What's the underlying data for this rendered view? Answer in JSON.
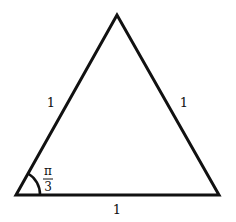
{
  "diagram": {
    "type": "equilateral-triangle",
    "vertices": {
      "apex": [
        117,
        15
      ],
      "bottom_left": [
        16,
        195
      ],
      "bottom_right": [
        219,
        195
      ]
    },
    "stroke_color": "#111111",
    "side_labels": {
      "left": "1",
      "right": "1",
      "bottom": "1"
    },
    "angle_label": {
      "numerator": "π",
      "denominator": "3"
    }
  }
}
